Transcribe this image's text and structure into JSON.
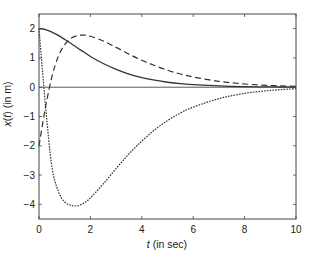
{
  "chart_data": {
    "type": "line",
    "title": "",
    "xlabel": "t (in sec)",
    "xlabel_var": "t",
    "xlabel_rest": " (in sec)",
    "ylabel": "x(t) (in m)",
    "ylabel_parts": [
      "x",
      "(",
      "t",
      ") (in m)"
    ],
    "xlim": [
      0,
      10
    ],
    "ylim": [
      -4.5,
      2.5
    ],
    "xticks": [
      0,
      2,
      4,
      6,
      8,
      10
    ],
    "yticks": [
      -4,
      -3,
      -2,
      -1,
      0,
      1,
      2
    ],
    "ytick_labels": [
      "−4",
      "−3",
      "−2",
      "−1",
      "0",
      "1",
      "2"
    ],
    "grid": false,
    "zero_line": true,
    "legend": null,
    "x": [
      0,
      0.25,
      0.5,
      0.75,
      1.0,
      1.25,
      1.5,
      1.75,
      2.0,
      2.5,
      3.0,
      3.5,
      4.0,
      4.5,
      5.0,
      5.5,
      6.0,
      7.0,
      8.0,
      9.0,
      10.0
    ],
    "series": [
      {
        "name": "solid",
        "style": "solid",
        "color": "#333333",
        "values": [
          2.0,
          1.97,
          1.88,
          1.77,
          1.63,
          1.49,
          1.34,
          1.2,
          1.05,
          0.81,
          0.61,
          0.45,
          0.33,
          0.24,
          0.17,
          0.12,
          0.09,
          0.045,
          0.02,
          0.01,
          0.005
        ]
      },
      {
        "name": "dashed",
        "style": "dashed",
        "color": "#333333",
        "values": [
          -2.0,
          -0.7,
          0.35,
          1.05,
          1.45,
          1.67,
          1.76,
          1.78,
          1.74,
          1.58,
          1.36,
          1.13,
          0.92,
          0.74,
          0.58,
          0.45,
          0.35,
          0.2,
          0.11,
          0.06,
          0.03
        ]
      },
      {
        "name": "dotted",
        "style": "dotted",
        "color": "#333333",
        "values": [
          2.0,
          -0.6,
          -2.7,
          -3.55,
          -3.92,
          -4.03,
          -4.05,
          -3.95,
          -3.78,
          -3.3,
          -2.78,
          -2.28,
          -1.84,
          -1.46,
          -1.14,
          -0.88,
          -0.68,
          -0.39,
          -0.21,
          -0.11,
          -0.05
        ]
      }
    ]
  },
  "plot_area": {
    "left": 39,
    "top": 14,
    "right": 296,
    "bottom": 219
  }
}
